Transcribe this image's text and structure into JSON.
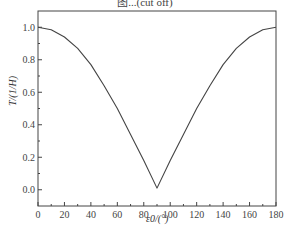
{
  "chart_data": {
    "type": "line",
    "title": "图...(cut off)",
    "xlabel": "ε0/(°)",
    "ylabel": "T/(1/H)",
    "xlim": [
      0,
      180
    ],
    "ylim": [
      -0.1,
      1.1
    ],
    "xticks": [
      "0",
      "20",
      "40",
      "60",
      "80",
      "100",
      "120",
      "140",
      "160",
      "180"
    ],
    "yticks": [
      "0.0",
      "0.2",
      "0.4",
      "0.6",
      "0.8",
      "1.0"
    ],
    "grid": false,
    "legend": null,
    "series": [
      {
        "name": "T",
        "x": [
          0,
          10,
          20,
          30,
          40,
          50,
          60,
          70,
          80,
          90,
          100,
          110,
          120,
          130,
          140,
          150,
          160,
          170,
          180
        ],
        "y": [
          1.0,
          0.985,
          0.94,
          0.87,
          0.77,
          0.64,
          0.5,
          0.34,
          0.18,
          0.01,
          0.18,
          0.34,
          0.5,
          0.64,
          0.77,
          0.87,
          0.94,
          0.985,
          1.0
        ]
      }
    ]
  }
}
